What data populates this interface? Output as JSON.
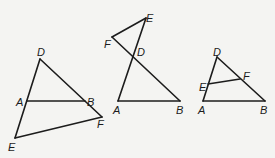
{
  "figures": [
    {
      "id": "figure-1",
      "points": {
        "D": {
          "x": 40,
          "y": 59,
          "label": "D",
          "lx": 37,
          "ly": 56
        },
        "A": {
          "x": 27,
          "y": 101,
          "label": "A",
          "lx": 16,
          "ly": 106
        },
        "B": {
          "x": 85,
          "y": 101,
          "label": "B",
          "lx": 87,
          "ly": 106
        },
        "F": {
          "x": 102,
          "y": 117,
          "label": "F",
          "lx": 97,
          "ly": 128
        },
        "E": {
          "x": 15,
          "y": 138,
          "label": "E",
          "lx": 8,
          "ly": 151
        }
      },
      "segments": [
        [
          "D",
          "E"
        ],
        [
          "D",
          "F"
        ],
        [
          "A",
          "B"
        ],
        [
          "E",
          "F"
        ]
      ]
    },
    {
      "id": "figure-2",
      "points": {
        "E": {
          "x": 146,
          "y": 18,
          "label": "E",
          "lx": 146,
          "ly": 22
        },
        "F": {
          "x": 112,
          "y": 37,
          "label": "F",
          "lx": 104,
          "ly": 48
        },
        "D": {
          "x": 134,
          "y": 57,
          "label": "D",
          "lx": 137,
          "ly": 56
        },
        "A": {
          "x": 118,
          "y": 101,
          "label": "A",
          "lx": 113,
          "ly": 114
        },
        "B": {
          "x": 180,
          "y": 101,
          "label": "B",
          "lx": 176,
          "ly": 114
        }
      },
      "segments": [
        [
          "E",
          "A"
        ],
        [
          "F",
          "B"
        ],
        [
          "E",
          "F"
        ],
        [
          "A",
          "B"
        ]
      ]
    },
    {
      "id": "figure-3",
      "points": {
        "D": {
          "x": 217,
          "y": 57,
          "label": "D",
          "lx": 213,
          "ly": 56
        },
        "E": {
          "x": 208,
          "y": 84,
          "label": "E",
          "lx": 199,
          "ly": 91
        },
        "F": {
          "x": 240,
          "y": 79,
          "label": "F",
          "lx": 243,
          "ly": 80
        },
        "A": {
          "x": 203,
          "y": 101,
          "label": "A",
          "lx": 198,
          "ly": 114
        },
        "B": {
          "x": 265,
          "y": 101,
          "label": "B",
          "lx": 260,
          "ly": 114
        }
      },
      "segments": [
        [
          "D",
          "A"
        ],
        [
          "D",
          "B"
        ],
        [
          "A",
          "B"
        ],
        [
          "E",
          "F"
        ]
      ]
    }
  ],
  "colors": {
    "ink": "#1c1c1c",
    "paper": "#f4f4f2"
  }
}
